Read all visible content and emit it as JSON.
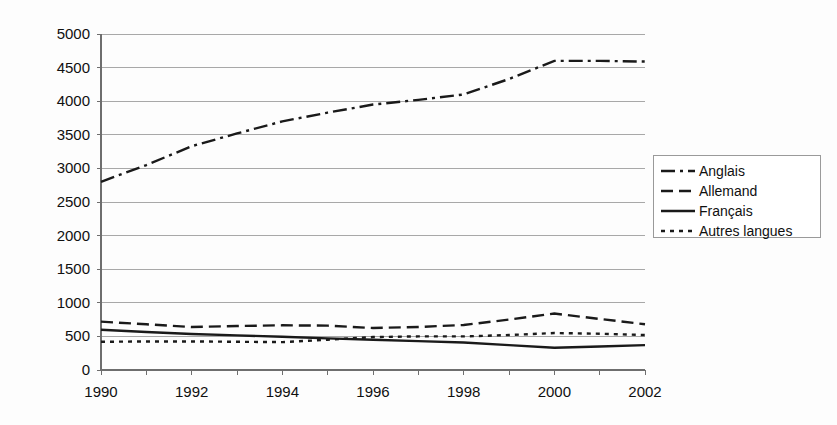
{
  "chart_data": {
    "type": "line",
    "title": "",
    "subtitle": "",
    "xlabel": "",
    "ylabel": "",
    "x": [
      1990,
      1991,
      1992,
      1993,
      1994,
      1995,
      1996,
      1997,
      1998,
      1999,
      2000,
      2001,
      2002
    ],
    "xlim": [
      1990,
      2002
    ],
    "ylim": [
      0,
      5000
    ],
    "grid": true,
    "legend_position": "right",
    "x_tick_labels": [
      "1990",
      "1992",
      "1994",
      "1996",
      "1998",
      "2000",
      "2002"
    ],
    "x_tick_values": [
      1990,
      1992,
      1994,
      1996,
      1998,
      2000,
      2002
    ],
    "x_minor_tick_values": [
      1991,
      1993,
      1995,
      1997,
      1999,
      2001
    ],
    "y_tick_labels": [
      "0",
      "500",
      "1000",
      "1500",
      "2000",
      "2500",
      "3000",
      "3500",
      "4000",
      "4500",
      "5000"
    ],
    "y_tick_values": [
      0,
      500,
      1000,
      1500,
      2000,
      2500,
      3000,
      3500,
      4000,
      4500,
      5000
    ],
    "series": [
      {
        "name": "Anglais",
        "style": "dashdot",
        "dash_array": "14,5,3,5",
        "color": "#1a1a1a",
        "values": [
          2800,
          3050,
          3330,
          3520,
          3700,
          3830,
          3950,
          4020,
          4100,
          4330,
          4600,
          4600,
          4590
        ]
      },
      {
        "name": "Allemand",
        "style": "dashed",
        "dash_array": "12,6",
        "color": "#1a1a1a",
        "values": [
          720,
          680,
          640,
          655,
          665,
          660,
          625,
          640,
          670,
          750,
          840,
          760,
          680
        ]
      },
      {
        "name": "Français",
        "style": "solid",
        "dash_array": "",
        "color": "#1a1a1a",
        "values": [
          600,
          565,
          535,
          515,
          495,
          470,
          450,
          430,
          410,
          370,
          330,
          350,
          370
        ]
      },
      {
        "name": "Autres langues",
        "style": "dotted",
        "dash_array": "4,5",
        "color": "#1a1a1a",
        "values": [
          420,
          425,
          425,
          420,
          415,
          450,
          490,
          500,
          500,
          520,
          550,
          540,
          520
        ]
      }
    ]
  },
  "legend": {
    "entries": [
      {
        "label": "Anglais"
      },
      {
        "label": "Allemand"
      },
      {
        "label": "Français"
      },
      {
        "label": "Autres langues"
      }
    ]
  }
}
